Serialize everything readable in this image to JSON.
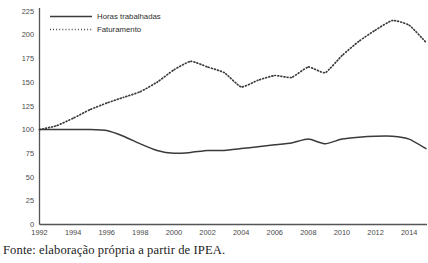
{
  "caption": "Fonte: elaboração própria a partir de IPEA.",
  "colors": {
    "series_line": "#3a3a3a",
    "axis": "#555555",
    "tick_text": "#4a4a4a",
    "background": "#ffffff"
  },
  "legend": {
    "position": "top-left-inside",
    "entries": [
      {
        "label": "Horas trabalhadas",
        "style": "solid"
      },
      {
        "label": "Faturamento",
        "style": "dotted"
      }
    ]
  },
  "chart_data": {
    "type": "line",
    "title": "",
    "xlabel": "",
    "ylabel": "",
    "xlim": [
      1992,
      2015
    ],
    "ylim": [
      0,
      225
    ],
    "grid": false,
    "legend_position": "top-left",
    "y_ticks": [
      0,
      25,
      50,
      75,
      100,
      125,
      150,
      175,
      200,
      225
    ],
    "x_ticks": [
      1992,
      1994,
      1996,
      1998,
      2000,
      2002,
      2004,
      2006,
      2008,
      2010,
      2012,
      2014
    ],
    "x": [
      1992,
      1993,
      1994,
      1995,
      1996,
      1997,
      1998,
      1999,
      2000,
      2001,
      2002,
      2003,
      2004,
      2005,
      2006,
      2007,
      2008,
      2009,
      2010,
      2011,
      2012,
      2013,
      2014,
      2015
    ],
    "series": [
      {
        "name": "Horas trabalhadas",
        "style": "solid",
        "values": [
          100,
          100,
          100,
          100,
          99,
          93,
          85,
          78,
          75,
          76,
          78,
          78,
          80,
          82,
          84,
          86,
          90,
          85,
          90,
          92,
          93,
          93,
          90,
          80
        ]
      },
      {
        "name": "Faturamento",
        "style": "dotted",
        "values": [
          100,
          104,
          112,
          121,
          128,
          134,
          140,
          150,
          163,
          172,
          166,
          160,
          145,
          152,
          157,
          155,
          166,
          160,
          178,
          193,
          205,
          215,
          210,
          192
        ]
      }
    ]
  }
}
